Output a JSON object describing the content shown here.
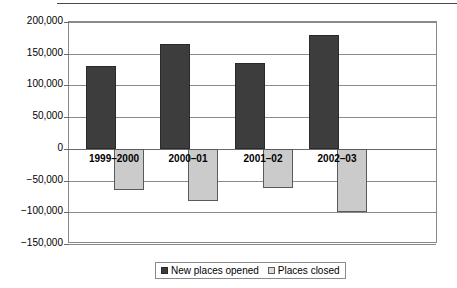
{
  "chart_data": {
    "type": "bar",
    "title": "",
    "xlabel": "",
    "ylabel": "",
    "ylim": [
      -150000,
      200000
    ],
    "ytick_step": 50000,
    "grid": true,
    "legend_position": "bottom",
    "categories": [
      "1999–2000",
      "2000–01",
      "2001–02",
      "2002–03"
    ],
    "ytick_labels": [
      "200,000",
      "150,000",
      "100,000",
      "50,000",
      "0",
      "−50,000",
      "−100,000",
      "−150,000"
    ],
    "ytick_values": [
      200000,
      150000,
      100000,
      50000,
      0,
      -50000,
      -100000,
      -150000
    ],
    "series": [
      {
        "name": "New places opened",
        "color": "#3d3d3d",
        "values": [
          130000,
          165000,
          135000,
          180000
        ]
      },
      {
        "name": "Places closed",
        "color": "#cbcbcb",
        "values": [
          -65000,
          -82000,
          -62000,
          -100000
        ]
      }
    ]
  },
  "legend": {
    "entries": [
      {
        "label": "New places opened"
      },
      {
        "label": "Places closed"
      }
    ]
  }
}
